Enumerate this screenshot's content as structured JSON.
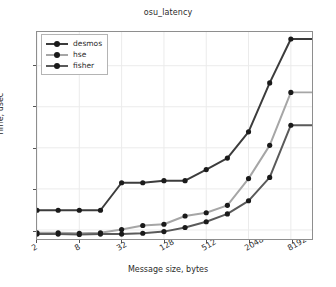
{
  "chart_data": {
    "type": "line",
    "title": "osu_latency",
    "xlabel": "Message size, bytes",
    "ylabel": "Time, usec",
    "grid": true,
    "legend_position": "upper-left",
    "x": [
      2,
      4,
      8,
      16,
      32,
      64,
      128,
      256,
      512,
      1024,
      2048,
      4096,
      8192,
      16384
    ],
    "xtick_labels": [
      "2",
      "8",
      "32",
      "128",
      "512",
      "2048",
      "8192"
    ],
    "xtick_indices": [
      0,
      2,
      4,
      6,
      8,
      10,
      12
    ],
    "ytick_labels": [
      "1",
      "2",
      "3",
      "4",
      "5"
    ],
    "ytick_values": [
      1,
      2,
      3,
      4,
      5
    ],
    "xlim_index": [
      0,
      13
    ],
    "ylim": [
      0.78,
      5.82
    ],
    "series": [
      {
        "name": "desmos",
        "color": "#3c3c3c",
        "values": [
          1.48,
          1.48,
          1.48,
          1.48,
          2.15,
          2.15,
          2.2,
          2.2,
          2.47,
          2.75,
          3.39,
          4.58,
          5.65,
          5.65
        ]
      },
      {
        "name": "hse",
        "color": "#a6a6a6",
        "values": [
          0.93,
          0.93,
          0.92,
          0.93,
          1.01,
          1.11,
          1.14,
          1.34,
          1.42,
          1.6,
          2.25,
          3.06,
          4.35,
          4.35
        ]
      },
      {
        "name": "fisher",
        "color": "#5a5a5a",
        "values": [
          0.9,
          0.9,
          0.89,
          0.9,
          0.9,
          0.92,
          0.96,
          1.06,
          1.2,
          1.39,
          1.71,
          2.28,
          3.55,
          3.55
        ]
      }
    ]
  }
}
